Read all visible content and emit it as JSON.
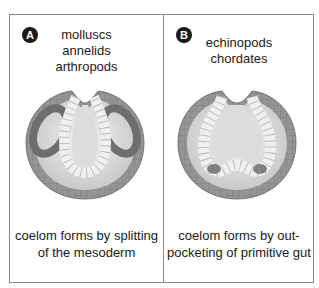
{
  "diagram": {
    "panels": [
      {
        "badge": "A",
        "groups": [
          "molluscs",
          "annelids",
          "arthropods"
        ],
        "caption_lines": [
          "coelom forms by splitting",
          "of the mesoderm"
        ],
        "type": "schizocoely"
      },
      {
        "badge": "B",
        "groups": [
          "echinopods",
          "chordates"
        ],
        "caption_lines": [
          "coelom forms by out-",
          "pocketing of primitive gut"
        ],
        "type": "enterocoely"
      }
    ],
    "colors": {
      "ectoderm": "#8f8f8f",
      "mesoderm": "#6e6e6e",
      "endoderm": "#eeeeee",
      "blastocoel": "#d9d9d9",
      "border": "#8a8a8a",
      "badge": "#1a1a1a"
    }
  }
}
